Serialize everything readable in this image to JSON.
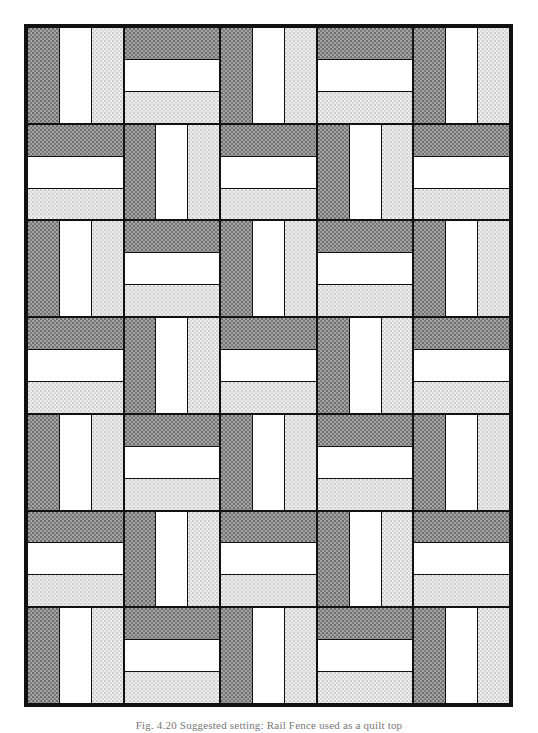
{
  "figure": {
    "caption": "Fig. 4.20 Suggested setting: Rail Fence used as a quilt top",
    "grid": {
      "columns": 5,
      "rows": 7
    },
    "block_pattern": "Rail Fence (3 strips: dark, white, light), orientation alternates in checkerboard",
    "strip_order": [
      "dark",
      "white",
      "light"
    ],
    "blocks": [
      [
        "vertical",
        "horizontal",
        "vertical",
        "horizontal",
        "vertical"
      ],
      [
        "horizontal",
        "vertical",
        "horizontal",
        "vertical",
        "horizontal"
      ],
      [
        "vertical",
        "horizontal",
        "vertical",
        "horizontal",
        "vertical"
      ],
      [
        "horizontal",
        "vertical",
        "horizontal",
        "vertical",
        "horizontal"
      ],
      [
        "vertical",
        "horizontal",
        "vertical",
        "horizontal",
        "vertical"
      ],
      [
        "horizontal",
        "vertical",
        "horizontal",
        "vertical",
        "horizontal"
      ],
      [
        "vertical",
        "horizontal",
        "vertical",
        "horizontal",
        "vertical"
      ]
    ],
    "colors": {
      "dark": "#a4a4a4",
      "white": "#ffffff",
      "light": "#ececec",
      "outline": "#111111"
    }
  }
}
